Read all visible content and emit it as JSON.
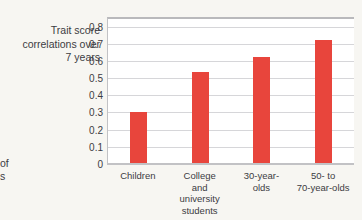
{
  "chart_data": {
    "type": "bar",
    "title": "",
    "xlabel": "",
    "ylabel": "Trait score correlations over 7 years",
    "ylabel_lines": [
      "Trait score",
      "correlations over",
      "7 years"
    ],
    "categories": [
      "Children",
      "College and university students",
      "30-year-olds",
      "50- to 70-year-olds"
    ],
    "category_lines": [
      [
        "Children"
      ],
      [
        "College",
        "and",
        "university",
        "students"
      ],
      [
        "30-year-",
        "olds"
      ],
      [
        "50- to",
        "70-year-olds"
      ]
    ],
    "values": [
      0.31,
      0.54,
      0.63,
      0.73
    ],
    "ylim": [
      0,
      0.85
    ],
    "yticks": [
      0,
      0.1,
      0.2,
      0.3,
      0.4,
      0.5,
      0.6,
      0.7,
      0.8
    ],
    "ytick_labels": [
      "0",
      "0.1",
      "0.2",
      "0.3",
      "0.4",
      "0.5",
      "0.6",
      "0.7",
      "0.8"
    ],
    "grid": true,
    "legend": "none",
    "bar_color": "#e8453c",
    "grid_color": "#d6d6d9",
    "axis_color": "#c2c2c5",
    "text_color": "#3c3c42",
    "background": "#f7f6f2",
    "plot_background": "#ffffff"
  },
  "cropped_caption_fragments": [
    "of",
    "s"
  ]
}
